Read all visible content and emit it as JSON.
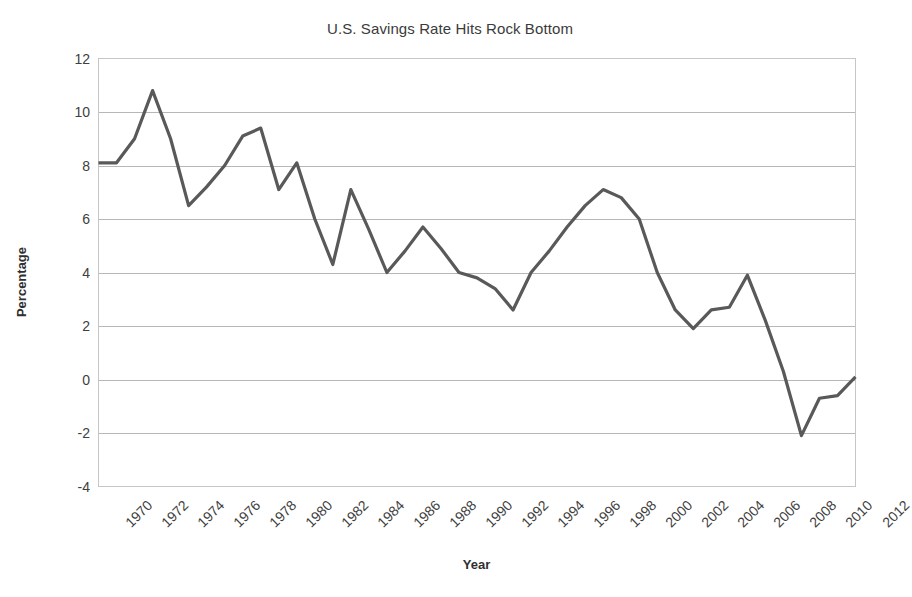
{
  "chart_data": {
    "type": "line",
    "title": "U.S. Savings Rate Hits Rock Bottom",
    "xlabel": "Year",
    "ylabel": "Percentage",
    "grid": true,
    "legend": "none",
    "line_color": "#595959",
    "xlim": [
      1970,
      2012
    ],
    "ylim": [
      -4,
      12
    ],
    "ytick_step": 2,
    "ytick_labels": [
      "12",
      "10",
      "8",
      "6",
      "4",
      "2",
      "0",
      "-2",
      "-4"
    ],
    "yticks": [
      12,
      10,
      8,
      6,
      4,
      2,
      0,
      -2,
      -4
    ],
    "xtick_labels": [
      "1970",
      "1972",
      "1974",
      "1976",
      "1978",
      "1980",
      "1982",
      "1984",
      "1986",
      "1988",
      "1990",
      "1992",
      "1994",
      "1996",
      "1998",
      "2000",
      "2002",
      "2004",
      "2006",
      "2008",
      "2010",
      "2012"
    ],
    "xticks": [
      1970,
      1972,
      1974,
      1976,
      1978,
      1980,
      1982,
      1984,
      1986,
      1988,
      1990,
      1992,
      1994,
      1996,
      1998,
      2000,
      2002,
      2004,
      2006,
      2008,
      2010,
      2012
    ],
    "x": [
      1970,
      1971,
      1972,
      1973,
      1974,
      1975,
      1976,
      1977,
      1978,
      1979,
      1980,
      1981,
      1982,
      1983,
      1984,
      1985,
      1986,
      1987,
      1988,
      1989,
      1990,
      1991,
      1992,
      1993,
      1994,
      1995,
      1996,
      1997,
      1998,
      1999,
      2000,
      2001,
      2002,
      2003,
      2004,
      2005,
      2006,
      2007,
      2008,
      2009,
      2010,
      2011,
      2012
    ],
    "values": [
      8.1,
      8.1,
      9.0,
      10.8,
      9.0,
      6.5,
      7.2,
      8.0,
      9.1,
      9.4,
      7.1,
      8.1,
      6.0,
      4.3,
      7.1,
      5.6,
      4.0,
      4.8,
      5.7,
      4.9,
      4.0,
      3.8,
      3.4,
      2.6,
      4.0,
      4.8,
      5.7,
      6.5,
      7.1,
      6.8,
      6.0,
      4.0,
      2.6,
      1.9,
      2.6,
      2.7,
      3.9,
      2.2,
      0.3,
      -2.1,
      -0.7,
      -0.6,
      0.1
    ]
  }
}
